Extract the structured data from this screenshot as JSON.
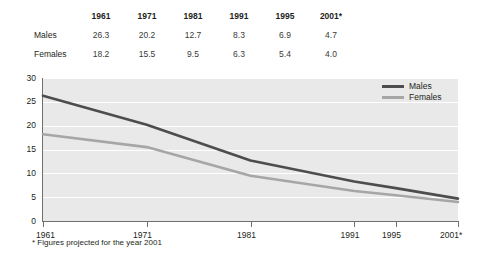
{
  "table": {
    "corner_label": "",
    "columns": [
      "1961",
      "1971",
      "1981",
      "1991",
      "1995",
      "2001*"
    ],
    "rows": [
      {
        "label": "Males",
        "values": [
          "26.3",
          "20.2",
          "12.7",
          "8.3",
          "6.9",
          "4.7"
        ]
      },
      {
        "label": "Females",
        "values": [
          "18.2",
          "15.5",
          "9.5",
          "6.3",
          "5.4",
          "4.0"
        ]
      }
    ]
  },
  "legend": {
    "items": [
      {
        "label": "Males",
        "color": "#4d4d4d"
      },
      {
        "label": "Females",
        "color": "#a6a6a6"
      }
    ]
  },
  "footnote": "* Figures projected for the year 2001",
  "axis": {
    "y_ticks": [
      "30",
      "25",
      "20",
      "15",
      "10",
      "5",
      "0"
    ],
    "x_ticks": [
      "1961",
      "1971",
      "1981",
      "1991",
      "1995",
      "2001*"
    ]
  },
  "chart_data": {
    "type": "line",
    "title": "",
    "subtitle": "",
    "xlabel": "",
    "ylabel": "",
    "x": [
      "1961",
      "1971",
      "1981",
      "1991",
      "1995",
      "2001*"
    ],
    "x_numeric": [
      1961,
      1971,
      1981,
      1991,
      1995,
      2001
    ],
    "series": [
      {
        "name": "Males",
        "values": [
          26.3,
          20.2,
          12.7,
          8.3,
          6.9,
          4.7
        ],
        "color": "#4d4d4d"
      },
      {
        "name": "Females",
        "values": [
          18.2,
          15.5,
          9.5,
          6.3,
          5.4,
          4.0
        ],
        "color": "#a6a6a6"
      }
    ],
    "ylim": [
      0,
      30
    ],
    "y_ticks": [
      0,
      5,
      10,
      15,
      20,
      25,
      30
    ],
    "grid": true,
    "grid_color": "#ffffff",
    "plot_background": "#e9e9e9",
    "legend_position": "top-right",
    "annotations": [
      "* Figures projected for the year 2001"
    ]
  }
}
